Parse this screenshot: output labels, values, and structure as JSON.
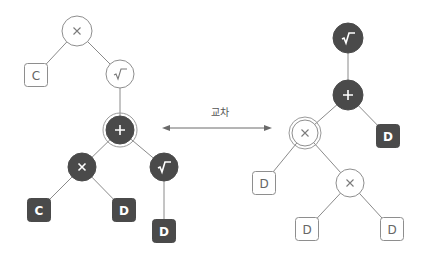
{
  "colors": {
    "dark_fill": "#4a4a4a",
    "light_fill": "#ffffff",
    "stroke": "#8e8e8e",
    "edge": "#8a8a8a"
  },
  "crossover": {
    "label": "교차",
    "label_pos": [
      220,
      104
    ],
    "arrow": {
      "x1": 162,
      "x2": 272,
      "y": 128
    }
  },
  "trees": [
    {
      "name": "left-tree",
      "nodes": [
        {
          "id": "L1",
          "shape": "circle",
          "op": "multiply",
          "label": "×",
          "style": "light",
          "x": 77,
          "y": 31,
          "r": 15
        },
        {
          "id": "L2",
          "shape": "box",
          "label": "C",
          "style": "light",
          "x": 36,
          "y": 75
        },
        {
          "id": "L3",
          "shape": "circle",
          "op": "sqrt",
          "label": "√",
          "style": "light",
          "x": 120,
          "y": 74,
          "r": 14
        },
        {
          "id": "L4",
          "shape": "circle",
          "op": "plus",
          "label": "+",
          "style": "dark",
          "x": 120,
          "y": 130,
          "r": 14,
          "ring": true
        },
        {
          "id": "L5",
          "shape": "circle",
          "op": "multiply",
          "label": "×",
          "style": "dark",
          "x": 82,
          "y": 167,
          "r": 14
        },
        {
          "id": "L6",
          "shape": "circle",
          "op": "sqrt",
          "label": "√",
          "style": "dark",
          "x": 164,
          "y": 167,
          "r": 14
        },
        {
          "id": "L7",
          "shape": "box",
          "label": "C",
          "style": "dark",
          "x": 39,
          "y": 210
        },
        {
          "id": "L8",
          "shape": "box",
          "label": "D",
          "style": "dark",
          "x": 124,
          "y": 210
        },
        {
          "id": "L9",
          "shape": "box",
          "label": "D",
          "style": "dark",
          "x": 164,
          "y": 231
        }
      ],
      "edges": [
        [
          "L1",
          "L2"
        ],
        [
          "L1",
          "L3"
        ],
        [
          "L3",
          "L4"
        ],
        [
          "L4",
          "L5"
        ],
        [
          "L4",
          "L6"
        ],
        [
          "L5",
          "L7"
        ],
        [
          "L5",
          "L8"
        ],
        [
          "L6",
          "L9"
        ]
      ]
    },
    {
      "name": "right-tree",
      "nodes": [
        {
          "id": "R1",
          "shape": "circle",
          "op": "sqrt",
          "label": "√",
          "style": "dark",
          "x": 348,
          "y": 38,
          "r": 15
        },
        {
          "id": "R2",
          "shape": "circle",
          "op": "plus",
          "label": "+",
          "style": "dark",
          "x": 348,
          "y": 95,
          "r": 15
        },
        {
          "id": "R3",
          "shape": "circle",
          "op": "multiply",
          "label": "×",
          "style": "light",
          "x": 305,
          "y": 133,
          "r": 13,
          "ring": true
        },
        {
          "id": "R4",
          "shape": "box",
          "label": "D",
          "style": "dark",
          "x": 388,
          "y": 136
        },
        {
          "id": "R5",
          "shape": "box",
          "label": "D",
          "style": "light",
          "x": 264,
          "y": 183
        },
        {
          "id": "R6",
          "shape": "circle",
          "op": "multiply",
          "label": "×",
          "style": "light",
          "x": 350,
          "y": 183,
          "r": 14
        },
        {
          "id": "R7",
          "shape": "box",
          "label": "D",
          "style": "light",
          "x": 307,
          "y": 229
        },
        {
          "id": "R8",
          "shape": "box",
          "label": "D",
          "style": "light",
          "x": 392,
          "y": 229
        }
      ],
      "edges": [
        [
          "R1",
          "R2"
        ],
        [
          "R2",
          "R3"
        ],
        [
          "R2",
          "R4"
        ],
        [
          "R3",
          "R5"
        ],
        [
          "R3",
          "R6"
        ],
        [
          "R6",
          "R7"
        ],
        [
          "R6",
          "R8"
        ]
      ]
    }
  ]
}
